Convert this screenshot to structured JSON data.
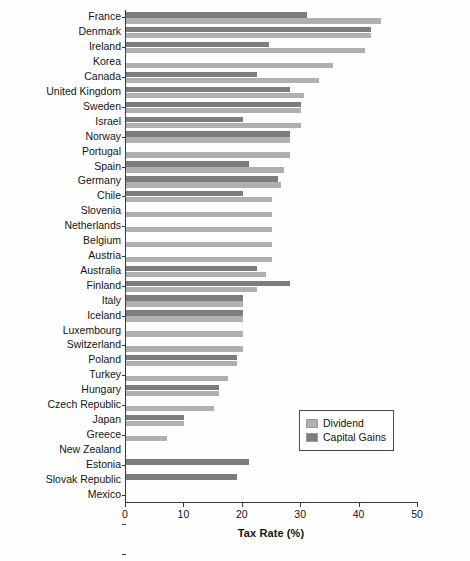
{
  "chart_data": {
    "type": "bar",
    "orientation": "horizontal",
    "title": "",
    "xlabel": "Tax Rate (%)",
    "ylabel": "",
    "xlim": [
      0,
      50
    ],
    "xticks": [
      0,
      10,
      20,
      30,
      40,
      50
    ],
    "grid": false,
    "legend_position": "center-right",
    "categories": [
      "France",
      "Denmark",
      "Ireland",
      "Korea",
      "Canada",
      "United Kingdom",
      "Sweden",
      "Israel",
      "Norway",
      "Portugal",
      "Spain",
      "Germany",
      "Chile",
      "Slovenia",
      "Netherlands",
      "Belgium",
      "Austria",
      "Australia",
      "Finland",
      "Italy",
      "Iceland",
      "Luxembourg",
      "Switzerland",
      "Poland",
      "Turkey",
      "Hungary",
      "Czech Republic",
      "Japan",
      "Greece",
      "New Zealand",
      "Estonia",
      "Slovak Republic",
      "Mexico"
    ],
    "series": [
      {
        "name": "Dividend",
        "color": "#b0b0b0",
        "values": [
          43.6,
          42.0,
          41.0,
          35.5,
          33.0,
          30.5,
          30.0,
          30.0,
          28.0,
          28.0,
          27.0,
          26.5,
          25.0,
          25.0,
          25.0,
          25.0,
          25.0,
          24.0,
          22.5,
          20.0,
          20.0,
          20.0,
          20.0,
          19.0,
          17.5,
          16.0,
          15.0,
          10.0,
          7.0,
          0,
          0,
          0,
          0
        ]
      },
      {
        "name": "Capital Gains",
        "color": "#7d7d7d",
        "values": [
          31.0,
          42.0,
          24.5,
          0,
          22.5,
          28.0,
          30.0,
          20.0,
          28.0,
          0,
          21.0,
          26.0,
          20.0,
          0,
          0,
          0,
          0,
          22.5,
          28.0,
          20.0,
          20.0,
          0,
          0,
          19.0,
          0,
          16.0,
          0,
          10.0,
          0,
          0,
          21.0,
          19.0,
          0
        ]
      }
    ]
  },
  "legend": {
    "entries": [
      {
        "label": "Dividend",
        "color": "#b0b0b0"
      },
      {
        "label": "Capital Gains",
        "color": "#7d7d7d"
      }
    ]
  }
}
